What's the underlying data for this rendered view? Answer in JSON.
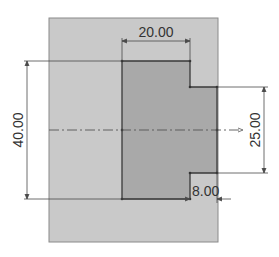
{
  "drawing": {
    "type": "sketch",
    "colors": {
      "background": "#ffffff",
      "sheet_fill": "#c9c9c9",
      "sheet_stroke": "#8a8a8a",
      "profile_fill": "#a9a9a9",
      "profile_stroke": "#3a3a3a",
      "dimension_line": "#4a4a4a",
      "centerline": "#555555"
    },
    "dimensions": {
      "top_width": "20.00",
      "overall_height": "40.00",
      "right_height": "25.00",
      "step_width": "8.00"
    },
    "centerline": {
      "style": "dash-dot"
    }
  }
}
